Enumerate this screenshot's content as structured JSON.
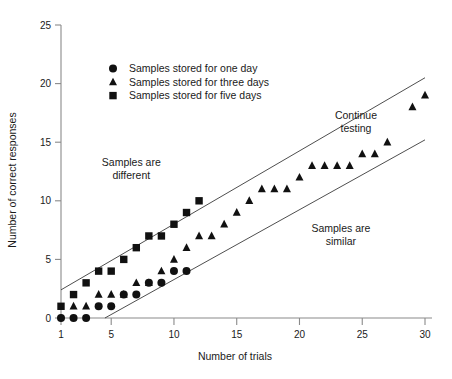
{
  "chart_data": {
    "type": "scatter",
    "title": "",
    "xlabel": "Number of trials",
    "ylabel": "Number of correct responses",
    "xlim": [
      1,
      30
    ],
    "ylim": [
      0,
      25
    ],
    "xticks": [
      1,
      5,
      10,
      15,
      20,
      25,
      30
    ],
    "yticks": [
      0,
      5,
      10,
      15,
      20,
      25
    ],
    "xtick_labels": [
      "1",
      "5",
      "10",
      "15",
      "20",
      "25",
      "30"
    ],
    "ytick_labels": [
      "0",
      "5",
      "10",
      "15",
      "20",
      "25"
    ],
    "grid": false,
    "legend_position": "upper-left",
    "marker_color": "#111111",
    "line_color": "#3a3a3a",
    "axis_color": "#8a8a8a",
    "series": [
      {
        "name": "Samples stored for one day",
        "marker": "circle",
        "points": [
          [
            1,
            0
          ],
          [
            2,
            0
          ],
          [
            3,
            0
          ],
          [
            4,
            1
          ],
          [
            5,
            1
          ],
          [
            6,
            2
          ],
          [
            7,
            2
          ],
          [
            8,
            3
          ],
          [
            9,
            3
          ],
          [
            10,
            4
          ],
          [
            11,
            4
          ]
        ]
      },
      {
        "name": "Samples stored for three days",
        "marker": "triangle",
        "points": [
          [
            2,
            1
          ],
          [
            3,
            1
          ],
          [
            4,
            2
          ],
          [
            5,
            2
          ],
          [
            6,
            2
          ],
          [
            7,
            3
          ],
          [
            8,
            3
          ],
          [
            9,
            4
          ],
          [
            10,
            5
          ],
          [
            11,
            6
          ],
          [
            12,
            7
          ],
          [
            13,
            7
          ],
          [
            14,
            8
          ],
          [
            15,
            9
          ],
          [
            16,
            10
          ],
          [
            17,
            11
          ],
          [
            18,
            11
          ],
          [
            19,
            11
          ],
          [
            20,
            12
          ],
          [
            21,
            13
          ],
          [
            22,
            13
          ],
          [
            23,
            13
          ],
          [
            24,
            13
          ],
          [
            25,
            14
          ],
          [
            26,
            14
          ],
          [
            27,
            15
          ],
          [
            29,
            18
          ],
          [
            30,
            19
          ]
        ]
      },
      {
        "name": "Samples stored for five days",
        "marker": "square",
        "points": [
          [
            1,
            1
          ],
          [
            2,
            2
          ],
          [
            3,
            3
          ],
          [
            4,
            4
          ],
          [
            5,
            4
          ],
          [
            6,
            5
          ],
          [
            7,
            6
          ],
          [
            8,
            7
          ],
          [
            9,
            7
          ],
          [
            10,
            8
          ],
          [
            11,
            9
          ],
          [
            12,
            10
          ]
        ]
      }
    ],
    "boundary_lines": [
      {
        "name": "upper-decision-boundary",
        "from": [
          1,
          2.4
        ],
        "to": [
          30,
          20.5
        ]
      },
      {
        "name": "lower-decision-boundary",
        "from": [
          4.5,
          0
        ],
        "to": [
          30,
          15.2
        ]
      }
    ],
    "annotations": [
      {
        "name": "samples-are-different",
        "lines": [
          "Samples are",
          "different"
        ],
        "x": 6.6,
        "y": 13.0
      },
      {
        "name": "continue-testing",
        "lines": [
          "Continue",
          "testing"
        ],
        "x": 24.5,
        "y": 17.0
      },
      {
        "name": "samples-are-similar",
        "lines": [
          "Samples are",
          "similar"
        ],
        "x": 23.3,
        "y": 7.3
      }
    ]
  },
  "legend": {
    "entries": [
      {
        "marker": "circle",
        "label": "Samples stored for one day"
      },
      {
        "marker": "triangle",
        "label": "Samples stored for three days"
      },
      {
        "marker": "square",
        "label": "Samples stored for five days"
      }
    ]
  },
  "axes": {
    "x_title": "Number of trials",
    "y_title": "Number of correct responses"
  }
}
